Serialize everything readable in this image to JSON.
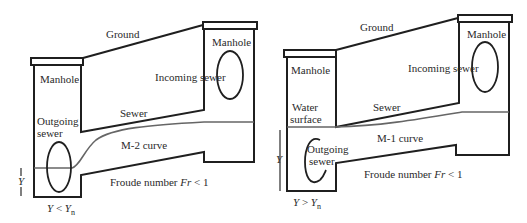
{
  "figure": {
    "left_panel": {
      "case": "M-2 curve",
      "labels": {
        "ground": "Ground",
        "manhole_downstream": "Manhole",
        "manhole_upstream": "Manhole",
        "incoming_sewer": "Incoming sewer",
        "sewer": "Sewer",
        "outgoing_sewer_line1": "Outgoing",
        "outgoing_sewer_line2": "sewer",
        "curve": "M-2 curve",
        "froude_prefix": "Froude number ",
        "froude_symbol": "Fr",
        "froude_suffix": " < 1",
        "depth_symbol": "Y",
        "condition_y": "Y",
        "condition_op": " < ",
        "condition_yn": "Y",
        "condition_sub": "n"
      }
    },
    "right_panel": {
      "case": "M-1 curve",
      "labels": {
        "ground": "Ground",
        "manhole_downstream": "Manhole",
        "manhole_upstream": "Manhole",
        "incoming_sewer": "Incoming sewer",
        "sewer": "Sewer",
        "water_surface_line1": "Water",
        "water_surface_line2": "surface",
        "outgoing_sewer_line1": "Outgoing",
        "outgoing_sewer_line2": "sewer",
        "curve": "M-1 curve",
        "froude_prefix": "Froude number ",
        "froude_symbol": "Fr",
        "froude_suffix": " < 1",
        "depth_symbol": "Y",
        "condition_y": "Y",
        "condition_op": " > ",
        "condition_yn": "Y",
        "condition_sub": "n"
      }
    },
    "colors": {
      "line": "#1f1f1f",
      "water_surface": "#666666",
      "text": "#2a2a2a",
      "background": "#ffffff"
    }
  }
}
